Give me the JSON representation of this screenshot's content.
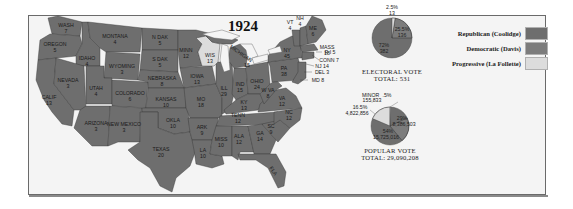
{
  "title": "1924",
  "colors": {
    "republican": "#6e6e6e",
    "democratic": "#7c7c7c",
    "progressive": "#dcdcdc",
    "water": "#f4f4f4",
    "border": "#3a3a3a"
  },
  "legend": [
    {
      "label": "Republican (Coolidge)",
      "color": "#6e6e6e"
    },
    {
      "label": "Democratic (Davis)",
      "color": "#7c7c7c"
    },
    {
      "label": "Progressive (La Follette)",
      "color": "#dcdcdc"
    }
  ],
  "states": [
    {
      "abbr": "WASH",
      "ev": "7"
    },
    {
      "abbr": "OREGON",
      "ev": "5"
    },
    {
      "abbr": "CALIF",
      "ev": "13"
    },
    {
      "abbr": "IDAHO",
      "ev": "4"
    },
    {
      "abbr": "NEVADA",
      "ev": "3"
    },
    {
      "abbr": "MONTANA",
      "ev": "4"
    },
    {
      "abbr": "WYOMING",
      "ev": "3"
    },
    {
      "abbr": "UTAH",
      "ev": "4"
    },
    {
      "abbr": "COLORADO",
      "ev": "6"
    },
    {
      "abbr": "ARIZONA",
      "ev": "3"
    },
    {
      "abbr": "NEW MEXICO",
      "ev": "3"
    },
    {
      "abbr": "N DAK",
      "ev": "5"
    },
    {
      "abbr": "S DAK",
      "ev": "5"
    },
    {
      "abbr": "NEBRASKA",
      "ev": "8"
    },
    {
      "abbr": "KANSAS",
      "ev": "10"
    },
    {
      "abbr": "OKLA",
      "ev": "10"
    },
    {
      "abbr": "TEXAS",
      "ev": "20"
    },
    {
      "abbr": "MINN",
      "ev": "12"
    },
    {
      "abbr": "IOWA",
      "ev": "13"
    },
    {
      "abbr": "MO",
      "ev": "18"
    },
    {
      "abbr": "ARK",
      "ev": "9"
    },
    {
      "abbr": "LA",
      "ev": "10"
    },
    {
      "abbr": "WIS",
      "ev": "13"
    },
    {
      "abbr": "ILL",
      "ev": "29"
    },
    {
      "abbr": "MICHIGAN",
      "ev": "15"
    },
    {
      "abbr": "IND",
      "ev": "15"
    },
    {
      "abbr": "OHIO",
      "ev": "24"
    },
    {
      "abbr": "KY",
      "ev": "13"
    },
    {
      "abbr": "TENN",
      "ev": "12"
    },
    {
      "abbr": "MISS",
      "ev": "10"
    },
    {
      "abbr": "ALA",
      "ev": "12"
    },
    {
      "abbr": "GA",
      "ev": "14"
    },
    {
      "abbr": "FLA",
      "ev": "6"
    },
    {
      "abbr": "SC",
      "ev": "9"
    },
    {
      "abbr": "NC",
      "ev": "12"
    },
    {
      "abbr": "VA",
      "ev": "12"
    },
    {
      "abbr": "W VA",
      "ev": "8"
    },
    {
      "abbr": "PA",
      "ev": "38"
    },
    {
      "abbr": "NY",
      "ev": "45"
    },
    {
      "abbr": "VT",
      "ev": "4"
    },
    {
      "abbr": "NH",
      "ev": "4"
    },
    {
      "abbr": "ME",
      "ev": "6"
    },
    {
      "abbr": "MASS",
      "ev": "18"
    },
    {
      "abbr": "R I",
      "ev": "5"
    },
    {
      "abbr": "CONN",
      "ev": "7"
    },
    {
      "abbr": "NJ",
      "ev": "14"
    },
    {
      "abbr": "DEL",
      "ev": "3"
    },
    {
      "abbr": "MD",
      "ev": "8"
    }
  ],
  "callouts": {
    "ri": "R I 5",
    "conn": "CONN 7",
    "nj": "NJ 14",
    "del": "DEL 3",
    "md": "MD 8"
  },
  "electoral": {
    "caption": "ELECTORAL VOTE",
    "total": "TOTAL: 531",
    "slices": [
      {
        "party": "Republican",
        "pct": "72%",
        "votes": "382"
      },
      {
        "party": "Democratic",
        "pct": "25.5%",
        "votes": "136"
      },
      {
        "party": "Progressive",
        "pct": "2.5%",
        "votes": "13"
      }
    ]
  },
  "popular": {
    "caption": "POPULAR VOTE",
    "total": "TOTAL: 29,090,208",
    "slices": [
      {
        "party": "Republican",
        "pct": "54%",
        "votes": "15,725,016"
      },
      {
        "party": "Democratic",
        "pct": "29%",
        "votes": "8,386,503"
      },
      {
        "party": "Progressive",
        "pct": "16.5%",
        "votes": "4,822,856"
      },
      {
        "party": "Minor",
        "label": "MINOR",
        "pct": ".5%",
        "votes": "155,833"
      }
    ]
  }
}
